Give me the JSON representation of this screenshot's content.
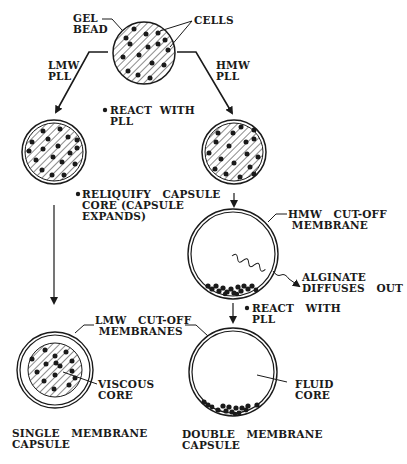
{
  "diagram": {
    "type": "process-flow",
    "colors": {
      "ink": "#1a1a1a",
      "background": "#ffffff"
    },
    "labels": {
      "gel_bead": "GEL\nBEAD",
      "cells": "CELLS",
      "lmw_pll": "LMW\nPLL",
      "hmw_pll": "HMW\nPLL",
      "react_with_pll_1": "REACT  WITH\nPLL",
      "reliquify": "RELIQUIFY   CAPSULE\nCORE (CAPSULE\nEXPANDS)",
      "hmw_membrane": "HMW   CUT-OFF\n MEMBRANE",
      "alginate": "ALGINATE\nDIFFUSES   OUT",
      "react_with_pll_2": "REACT   WITH\nPLL",
      "lmw_membranes": "LMW   CUT-OFF\n MEMBRANES",
      "viscous_core": "VISCOUS\nCORE",
      "fluid_core": "FLUID\nCORE",
      "single_capsule": "SINGLE   MEMBRANE\nCAPSULE",
      "double_capsule": "DOUBLE   MEMBRANE\nCAPSULE"
    },
    "nodes": [
      {
        "id": "gel-bead",
        "shape": "hatched-circle-with-cells",
        "cx": 144,
        "cy": 53,
        "r": 31
      },
      {
        "id": "lmw-coated-bead",
        "shape": "hatched-circle-with-cells-membrane",
        "cx": 54,
        "cy": 152,
        "r": 32
      },
      {
        "id": "hmw-coated-bead",
        "shape": "hatched-circle-with-cells-membrane",
        "cx": 234,
        "cy": 152,
        "r": 32
      },
      {
        "id": "hmw-membrane-capsule",
        "shape": "double-ring-cells-bottom",
        "cx": 233,
        "cy": 254,
        "r": 45
      },
      {
        "id": "single-membrane-capsule",
        "shape": "double-ring-hatched-core",
        "cx": 55,
        "cy": 370,
        "r": 38,
        "core_r": 27
      },
      {
        "id": "double-membrane-capsule",
        "shape": "double-ring-cells-bottom",
        "cx": 233,
        "cy": 372,
        "r": 44
      }
    ],
    "edges": [
      {
        "from": "gel-bead",
        "to": "lmw-coated-bead",
        "label": "LMW PLL"
      },
      {
        "from": "gel-bead",
        "to": "hmw-coated-bead",
        "label": "HMW PLL"
      },
      {
        "from": "lmw-coated-bead",
        "to": "single-membrane-capsule"
      },
      {
        "from": "hmw-coated-bead",
        "to": "hmw-membrane-capsule"
      },
      {
        "from": "hmw-membrane-capsule",
        "to": "double-membrane-capsule",
        "label": "REACT WITH PLL"
      }
    ]
  }
}
